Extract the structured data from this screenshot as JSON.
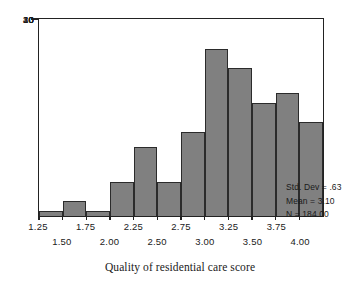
{
  "chart_data": {
    "type": "bar",
    "title": "",
    "xlabel": "Quality of residential care score",
    "ylabel": "",
    "categories": [
      "1.25",
      "1.50",
      "1.75",
      "2.00",
      "2.25",
      "2.50",
      "2.75",
      "3.00",
      "3.25",
      "3.50",
      "3.75",
      "4.00"
    ],
    "bin_starts": [
      1.25,
      1.5,
      1.75,
      2.0,
      2.25,
      2.5,
      2.75,
      3.0,
      3.25,
      3.5,
      3.75,
      4.0
    ],
    "bin_width": 0.25,
    "values": [
      1,
      3,
      1,
      7,
      14,
      7,
      17,
      34,
      30,
      23,
      25,
      19
    ],
    "ylim": [
      0,
      40
    ],
    "xlim": [
      1.25,
      4.25
    ],
    "yticks": [
      "0",
      "10",
      "20",
      "30",
      "40"
    ],
    "ytick_values": [
      0,
      10,
      20,
      30,
      40
    ],
    "xticks_upper": [
      "1.25",
      "1.75",
      "2.25",
      "2.75",
      "3.25",
      "3.75"
    ],
    "xticks_lower": [
      "1.50",
      "2.00",
      "2.50",
      "3.00",
      "3.50",
      "4.00"
    ],
    "xtick_upper_values": [
      1.25,
      1.75,
      2.25,
      2.75,
      3.25,
      3.75
    ],
    "xtick_lower_values": [
      1.5,
      2.0,
      2.5,
      3.0,
      3.5,
      4.0
    ],
    "grid": false,
    "legend": false,
    "bar_color": "#808080",
    "bar_edge_color": "#2b2b2b",
    "axis_color": "#222222",
    "background": "#ffffff"
  },
  "stats": {
    "std_dev": "Std. Dev = .63",
    "mean": "Mean = 3.10",
    "n": "N = 184.00"
  },
  "axis_title": {
    "x": "Quality of residential care score"
  }
}
